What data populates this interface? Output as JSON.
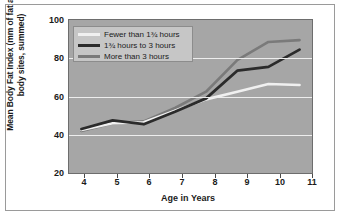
{
  "chart_data": {
    "type": "line",
    "title": "",
    "xlabel": "Age in Years",
    "ylabel": "Mean Body Fat Index (mm of fat at five body sites, summed)",
    "x": [
      4,
      5,
      6,
      7,
      8,
      9,
      10,
      11
    ],
    "xticklabels": [
      "4",
      "5",
      "6",
      "7",
      "8",
      "9",
      "10",
      "11"
    ],
    "yticklabels": [
      "20",
      "40",
      "60",
      "80",
      "100"
    ],
    "yticks": [
      20,
      40,
      60,
      80,
      100
    ],
    "xlim": [
      3.6,
      11.4
    ],
    "ylim": [
      20,
      100
    ],
    "grid": "horizontal",
    "legend_position": "upper-left-inside",
    "plot_background": "#a6a6a6",
    "gridline_color": "#ededed",
    "series": [
      {
        "name": "Fewer than 1¾ hours",
        "color": "#f0f0f0",
        "values": [
          42.5,
          46.0,
          46.5,
          52.5,
          58.5,
          62.5,
          66.5,
          66.0
        ]
      },
      {
        "name": "1¾ hours to 3 hours",
        "color": "#2b2b2b",
        "values": [
          43.0,
          47.5,
          45.5,
          52.0,
          59.0,
          73.5,
          75.5,
          84.5
        ]
      },
      {
        "name": "More than 3 hours",
        "color": "#7a7a7a",
        "values": [
          42.0,
          46.0,
          47.0,
          54.0,
          62.5,
          79.0,
          88.5,
          89.5
        ]
      }
    ]
  },
  "legend": {
    "items": [
      {
        "label": "Fewer than 1¾ hours",
        "color": "#f0f0f0"
      },
      {
        "label": "1¾ hours to 3 hours",
        "color": "#2b2b2b"
      },
      {
        "label": "More than 3 hours",
        "color": "#7a7a7a"
      }
    ]
  },
  "axes": {
    "x_title": "Age in Years",
    "y_title": "Mean Body Fat Index (mm of fat at five body sites, summed)",
    "y_ticks": [
      "100",
      "80",
      "60",
      "40",
      "20"
    ],
    "x_ticks": [
      "4",
      "5",
      "6",
      "7",
      "8",
      "9",
      "10",
      "11"
    ]
  }
}
